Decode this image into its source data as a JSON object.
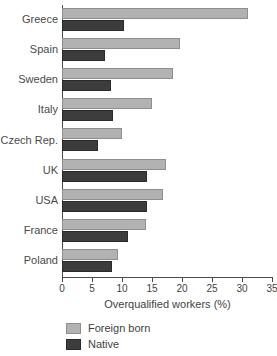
{
  "chart_data": {
    "type": "bar",
    "orientation": "horizontal",
    "title": "",
    "xlabel": "Overqualified workers (%)",
    "ylabel": "",
    "xlim": [
      0,
      35
    ],
    "xticks": [
      0,
      5,
      10,
      15,
      20,
      25,
      30,
      35
    ],
    "xtick_labels": [
      "0",
      "5",
      "10",
      "15",
      "20",
      "25",
      "30",
      "35"
    ],
    "grid": false,
    "legend_position": "bottom-left",
    "categories": [
      "Greece",
      "Spain",
      "Sweden",
      "Italy",
      "Czech Rep.",
      "UK",
      "USA",
      "France",
      "Poland"
    ],
    "series": [
      {
        "name": "Foreign born",
        "color": "#b2b2b2",
        "values": [
          31.0,
          19.7,
          18.5,
          15.0,
          10.0,
          17.3,
          16.8,
          14.0,
          9.3
        ]
      },
      {
        "name": "Native",
        "color": "#3c3c3c",
        "values": [
          10.3,
          7.2,
          8.2,
          8.5,
          6.0,
          14.2,
          14.2,
          11.0,
          8.3
        ]
      }
    ]
  },
  "axis": {
    "x_title": "Overqualified workers (%)"
  },
  "legend": {
    "items": [
      {
        "label": "Foreign born",
        "color": "#b2b2b2"
      },
      {
        "label": "Native",
        "color": "#3c3c3c"
      }
    ]
  }
}
